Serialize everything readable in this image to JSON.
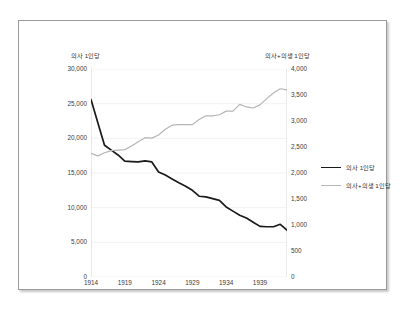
{
  "chart_data": {
    "type": "line",
    "title": "",
    "xlabel": "",
    "grid": "horizontal-faint",
    "legend_position": "right",
    "x": [
      1914,
      1915,
      1916,
      1917,
      1918,
      1919,
      1920,
      1921,
      1922,
      1923,
      1924,
      1925,
      1926,
      1927,
      1928,
      1929,
      1930,
      1931,
      1932,
      1933,
      1934,
      1935,
      1936,
      1937,
      1938,
      1939,
      1940,
      1941,
      1942,
      1943
    ],
    "xticks": [
      1914,
      1919,
      1924,
      1929,
      1934,
      1939
    ],
    "xlim": [
      1914,
      1943
    ],
    "axes": [
      {
        "id": "left",
        "title": "의사 1인당",
        "ylim": [
          0,
          30000
        ],
        "ystep": 5000,
        "yticks": [
          "30,000",
          "25,000",
          "20,000",
          "15,000",
          "10,000",
          "5,000",
          "0"
        ],
        "ytick_values": [
          30000,
          25000,
          20000,
          15000,
          10000,
          5000,
          0
        ]
      },
      {
        "id": "right",
        "title": "의사+의생 1인당",
        "ylim": [
          0,
          4000
        ],
        "ystep": 500,
        "yticks": [
          "4,000",
          "3,500",
          "3,000",
          "2,500",
          "2,000",
          "1,500",
          "1,000",
          "500",
          "0"
        ],
        "ytick_values": [
          4000,
          3500,
          3000,
          2500,
          2000,
          1500,
          1000,
          500,
          0
        ]
      }
    ],
    "series": [
      {
        "name": "의사 1인당",
        "axis": "left",
        "color": "#1a1a1a",
        "width": 1.7,
        "values": [
          25600,
          22300,
          19000,
          18300,
          17600,
          16700,
          16650,
          16600,
          16750,
          16600,
          15150,
          14700,
          14150,
          13600,
          13100,
          12500,
          11650,
          11550,
          11300,
          11050,
          10100,
          9500,
          8900,
          8500,
          7900,
          7300,
          7250,
          7250,
          7600,
          6750
        ]
      },
      {
        "name": "의사+의생 1인당",
        "axis": "right",
        "color": "#b5b5b5",
        "width": 1.2,
        "values": [
          2380,
          2330,
          2390,
          2430,
          2440,
          2450,
          2520,
          2600,
          2680,
          2670,
          2730,
          2840,
          2920,
          2930,
          2930,
          2930,
          3030,
          3100,
          3100,
          3120,
          3190,
          3190,
          3320,
          3270,
          3250,
          3310,
          3430,
          3540,
          3620,
          3600
        ]
      }
    ]
  },
  "legend": {
    "items": [
      {
        "label": "의사 1인당"
      },
      {
        "label": "의사+의생 1인당"
      }
    ]
  }
}
